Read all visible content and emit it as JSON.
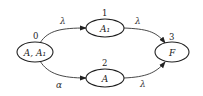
{
  "diagram": {
    "type": "state-transition-graph",
    "nodes": [
      {
        "id": "0",
        "number": "0",
        "label": "A, A₁"
      },
      {
        "id": "1",
        "number": "1",
        "label": "A₁"
      },
      {
        "id": "2",
        "number": "2",
        "label": "A"
      },
      {
        "id": "3",
        "number": "3",
        "label": "F"
      }
    ],
    "edges": [
      {
        "from": "0",
        "to": "1",
        "label": "λ"
      },
      {
        "from": "0",
        "to": "2",
        "label": "α"
      },
      {
        "from": "1",
        "to": "3",
        "label": "λ"
      },
      {
        "from": "2",
        "to": "3",
        "label": "λ"
      }
    ]
  }
}
